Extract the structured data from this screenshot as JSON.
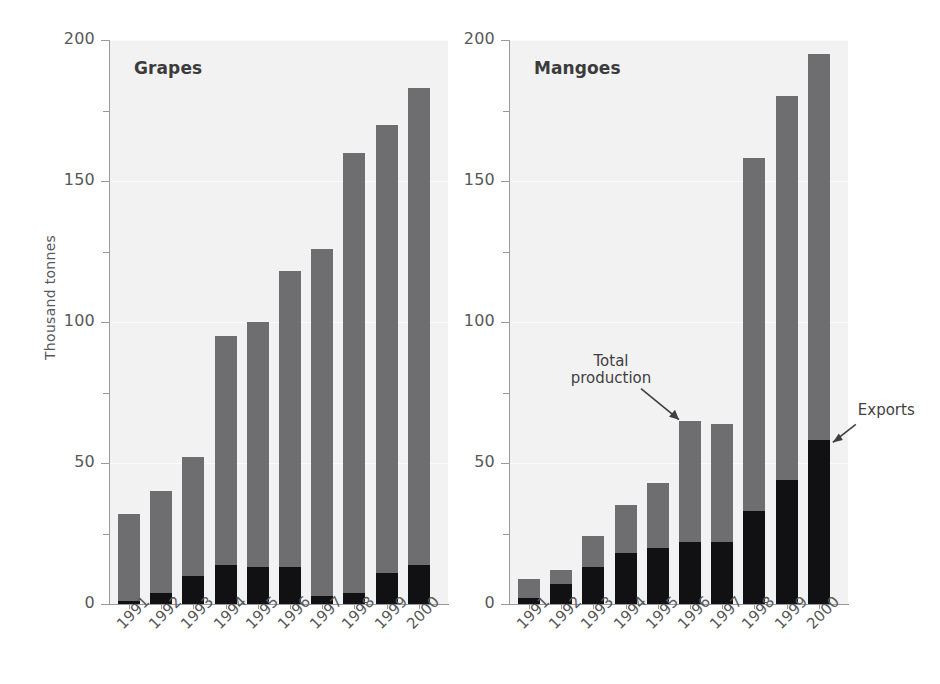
{
  "figure": {
    "ylabel": "Thousand tonnes",
    "ytick_labels": [
      "200",
      "150",
      "100",
      "50",
      "0"
    ]
  },
  "panels": [
    {
      "id": "grapes",
      "title": "Grapes",
      "annotations": []
    },
    {
      "id": "mangoes",
      "title": "Mangoes",
      "annotations": [
        {
          "name": "total-production",
          "text": "Total\nproduction"
        },
        {
          "name": "exports",
          "text": "Exports"
        }
      ]
    }
  ],
  "chart_data": [
    {
      "type": "bar",
      "title": "Grapes",
      "xlabel": "",
      "ylabel": "Thousand tonnes",
      "ylim": [
        0,
        200
      ],
      "yticks": [
        0,
        50,
        100,
        150,
        200
      ],
      "yticks_minor": [
        25,
        75,
        125,
        175
      ],
      "grid": true,
      "stacked": true,
      "legend": "none",
      "categories": [
        "1991",
        "1992",
        "1993",
        "1994",
        "1995",
        "1996",
        "1997",
        "1998",
        "1999",
        "2000"
      ],
      "series": [
        {
          "name": "Total production",
          "color": "#6e6e70",
          "values": [
            32,
            40,
            52,
            95,
            100,
            118,
            126,
            160,
            170,
            183
          ]
        },
        {
          "name": "Exports",
          "color": "#111113",
          "values": [
            1,
            4,
            10,
            14,
            13,
            13,
            3,
            4,
            11,
            14
          ]
        }
      ]
    },
    {
      "type": "bar",
      "title": "Mangoes",
      "xlabel": "",
      "ylabel": "Thousand tonnes",
      "ylim": [
        0,
        200
      ],
      "yticks": [
        0,
        50,
        100,
        150,
        200
      ],
      "yticks_minor": [
        25,
        75,
        125,
        175
      ],
      "grid": true,
      "stacked": true,
      "legend": "annotations",
      "categories": [
        "1991",
        "1992",
        "1993",
        "1994",
        "1995",
        "1996",
        "1997",
        "1998",
        "1999",
        "2000"
      ],
      "series": [
        {
          "name": "Total production",
          "color": "#6e6e70",
          "values": [
            9,
            12,
            24,
            35,
            43,
            65,
            64,
            158,
            180,
            195
          ]
        },
        {
          "name": "Exports",
          "color": "#111113",
          "values": [
            2,
            7,
            13,
            18,
            20,
            22,
            22,
            33,
            44,
            58
          ]
        }
      ],
      "annotations": [
        {
          "text": "Total\nproduction",
          "points_to": {
            "category": "1996",
            "series": "Total production"
          }
        },
        {
          "text": "Exports",
          "points_to": {
            "category": "2000",
            "series": "Exports"
          }
        }
      ]
    }
  ]
}
